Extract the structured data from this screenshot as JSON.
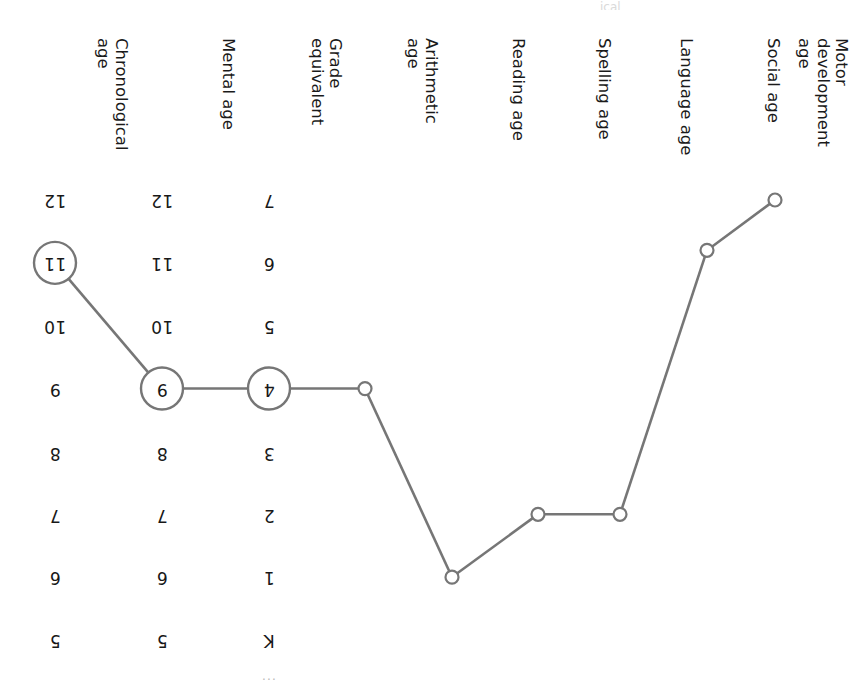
{
  "figure": {
    "orientation": "rotated-180",
    "background_color": "#ffffff",
    "line_color": "#767676",
    "marker_fill": "#ffffff",
    "text_color": "#1a1a1a",
    "partial_top_caption": "...",
    "partial_bottom_caption": "ical"
  },
  "chart_data": {
    "type": "line",
    "title": "",
    "xlabel": "",
    "ylabel": "",
    "grid": false,
    "legend": "none",
    "categories": [
      "Motor development age",
      "Social age",
      "Language age",
      "Spelling age",
      "Reading age",
      "Arithmetic age",
      "Grade equivalent",
      "Mental age",
      "Chronological age"
    ],
    "category_lines": [
      [
        "Motor",
        "development",
        "age"
      ],
      [
        "Social age"
      ],
      [
        "Language age"
      ],
      [
        "Spelling age"
      ],
      [
        "Reading age"
      ],
      [
        "Arithmetic",
        "age"
      ],
      [
        "Grade",
        "equivalent"
      ],
      [
        "Mental age"
      ],
      [
        "Chronological",
        "age"
      ]
    ],
    "row_count": 8,
    "row_labels_age": [
      "5",
      "6",
      "7",
      "8",
      "9",
      "10",
      "11",
      "12"
    ],
    "row_labels_grade": [
      "K",
      "1",
      "2",
      "3",
      "4",
      "5",
      "6",
      "7"
    ],
    "series": [
      {
        "name": "Child profile",
        "points": [
          {
            "category": "Motor development age",
            "row": 7.0,
            "value": "12",
            "marker": "open-circle"
          },
          {
            "category": "Social age",
            "row": 6.2,
            "value": "11+",
            "marker": "open-circle"
          },
          {
            "category": "Language age",
            "row": 2.0,
            "value": "7",
            "marker": "open-circle"
          },
          {
            "category": "Spelling age",
            "row": 2.0,
            "value": "7",
            "marker": "open-circle"
          },
          {
            "category": "Reading age",
            "row": 1.0,
            "value": "6",
            "marker": "open-circle"
          },
          {
            "category": "Arithmetic age",
            "row": 4.0,
            "value": "9",
            "marker": "open-circle"
          },
          {
            "category": "Grade equivalent",
            "row": 4.0,
            "value": "3",
            "marker": "circled-value"
          },
          {
            "category": "Mental age",
            "row": 4.0,
            "value": "8",
            "marker": "circled-value"
          },
          {
            "category": "Chronological age",
            "row": 6.0,
            "value": "11",
            "marker": "circled-value"
          }
        ]
      }
    ],
    "scale_columns": [
      {
        "category": "Grade equivalent",
        "values": [
          "K",
          "1",
          "2",
          "3",
          "4",
          "5",
          "6",
          "7"
        ],
        "highlighted_value": "3"
      },
      {
        "category": "Mental age",
        "values": [
          "5",
          "6",
          "7",
          "8",
          "9",
          "10",
          "11",
          "12"
        ],
        "highlighted_value": "8"
      },
      {
        "category": "Chronological age",
        "values": [
          "5",
          "6",
          "7",
          "8",
          "9",
          "10",
          "11",
          "12"
        ],
        "highlighted_value": "11"
      }
    ]
  }
}
